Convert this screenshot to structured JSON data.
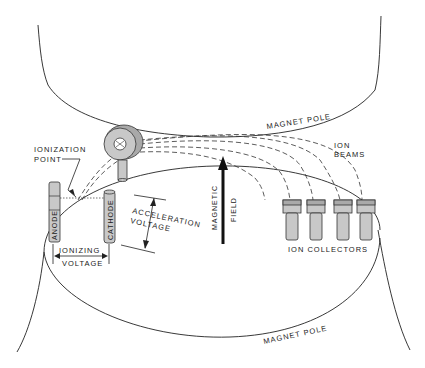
{
  "diagram": {
    "type": "mass-spectrometer-schematic",
    "labels": {
      "magnet_pole_top": "MAGNET POLE",
      "magnet_pole_bottom": "MAGNET POLE",
      "ionization_point_line1": "IONIZATION",
      "ionization_point_line2": "POINT",
      "ion_beams_line1": "ION",
      "ion_beams_line2": "BEAMS",
      "anode": "ANODE",
      "cathode": "CATHODE",
      "acceleration_line1": "ACCELERATION",
      "acceleration_line2": "VOLTAGE",
      "magnetic_field_line1": "MAGNETIC",
      "magnetic_field_line2": "FIELD",
      "ionizing_line1": "IONIZING",
      "ionizing_line2": "VOLTAGE",
      "ion_collectors": "ION COLLECTORS"
    },
    "components": [
      "magnet-pole-upper",
      "magnet-pole-lower",
      "anode",
      "cathode",
      "ion-source-ring",
      "ion-beams",
      "ion-collectors",
      "magnetic-field-arrow"
    ],
    "collector_count": 4,
    "beam_count": 4,
    "colors": {
      "line": "#222222",
      "part_fill": "#c8c8c8",
      "background": "#ffffff"
    }
  }
}
